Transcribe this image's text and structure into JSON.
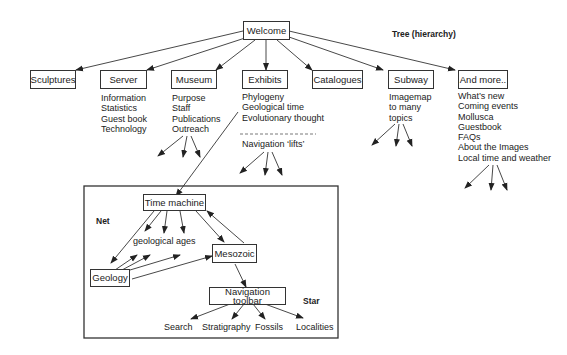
{
  "title": "Tree (hierarchy)",
  "root": {
    "label": "Welcome"
  },
  "tree": {
    "nodes": [
      {
        "id": "sculptures",
        "label": "Sculptures",
        "children": []
      },
      {
        "id": "server",
        "label": "Server",
        "children": [
          "Information",
          "Statistics",
          "Guest book",
          "Technology"
        ]
      },
      {
        "id": "museum",
        "label": "Museum",
        "children": [
          "Purpose",
          "Staff",
          "Publications",
          "Outreach"
        ]
      },
      {
        "id": "exhibits",
        "label": "Exhibits",
        "children": [
          "Phylogeny",
          "Geological time",
          "Evolutionary thought"
        ],
        "navigation_label": "Navigation ‘lifts’"
      },
      {
        "id": "catalogues",
        "label": "Catalogues",
        "children": []
      },
      {
        "id": "subway",
        "label": "Subway",
        "children": [
          "Imagemap",
          "to many",
          "topics"
        ]
      },
      {
        "id": "and-more",
        "label": "And more..",
        "children": [
          "What’s new",
          "Coming events",
          "Mollusca",
          "Guestbook",
          "FAQs",
          "About the Images",
          "Local time and weather"
        ]
      }
    ]
  },
  "net_section": {
    "net_label": "Net",
    "star_label": "Star",
    "time_machine": "Time machine",
    "geological_ages": "geological ages",
    "geology": "Geology",
    "mesozoic": "Mesozoic",
    "navigation_toolbar": "Navigation toolbar",
    "toolbar_items": [
      "Search",
      "Stratigraphy",
      "Fossils",
      "Localities"
    ]
  }
}
